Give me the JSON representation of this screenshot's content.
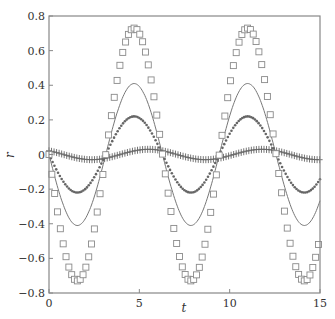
{
  "chart_data": {
    "type": "line",
    "title": "",
    "xlabel": "t",
    "ylabel": "r",
    "xlim": [
      0,
      15
    ],
    "ylim": [
      -0.8,
      0.8
    ],
    "xticks": [
      0,
      5,
      10,
      15
    ],
    "xtick_labels": [
      "0",
      "5",
      "10",
      "15"
    ],
    "yticks": [
      -0.8,
      -0.6,
      -0.4,
      -0.2,
      0,
      0.2,
      0.4,
      0.6,
      0.8
    ],
    "ytick_labels": [
      "−0.8",
      "−0.6",
      "−0.4",
      "−0.2",
      "0",
      "0.2",
      "0.4",
      "0.6",
      "0.8"
    ],
    "grid": false,
    "legend": null,
    "series": [
      {
        "name": "squares",
        "marker": "square-open",
        "style": "markers",
        "color": "#8a8a8a",
        "model": "-0.73*sin(t)",
        "amplitude": 0.73,
        "peaks_t": [
          4.7,
          11.0
        ],
        "troughs_t": [
          1.6,
          7.9,
          14.1
        ],
        "x": [
          0,
          0.1,
          0.2,
          0.3,
          0.4,
          0.5,
          0.7,
          0.8,
          0.9,
          1.1,
          1.3,
          1.5,
          1.6,
          1.8,
          2.0,
          2.2,
          2.5,
          2.8,
          3.0,
          3.1,
          3.2,
          3.3,
          3.4,
          3.5,
          3.7,
          3.8,
          3.9,
          4.0,
          4.1,
          4.3,
          4.5,
          4.6,
          4.7,
          4.8,
          5.0,
          5.2,
          5.4,
          5.6,
          5.9,
          6.1,
          6.2
        ],
        "y": [
          0.0,
          -0.07,
          -0.15,
          -0.21,
          -0.28,
          -0.34,
          -0.46,
          -0.52,
          -0.57,
          -0.65,
          -0.7,
          -0.73,
          -0.73,
          -0.71,
          -0.66,
          -0.58,
          -0.44,
          -0.25,
          -0.1,
          -0.03,
          0.04,
          0.11,
          0.19,
          0.26,
          0.38,
          0.45,
          0.5,
          0.55,
          0.6,
          0.66,
          0.71,
          0.73,
          0.73,
          0.72,
          0.7,
          0.64,
          0.56,
          0.46,
          0.27,
          0.13,
          0.06
        ]
      },
      {
        "name": "solid",
        "marker": "none",
        "style": "line",
        "color": "#777777",
        "model": "-0.41*sin(t)",
        "amplitude": 0.41,
        "peak_value": 0.41,
        "trough_value": -0.41
      },
      {
        "name": "dots",
        "marker": "filled-circle",
        "style": "markers",
        "color": "#666666",
        "model": "-0.22*sin(t)",
        "amplitude": 0.22,
        "peak_value": 0.22,
        "trough_value": -0.21
      },
      {
        "name": "plus",
        "marker": "plus",
        "style": "markers",
        "color": "#666666",
        "model": "-0.03*sin(t-0.8)",
        "amplitude": 0.03,
        "peak_value": 0.03,
        "trough_value": -0.03
      }
    ]
  }
}
